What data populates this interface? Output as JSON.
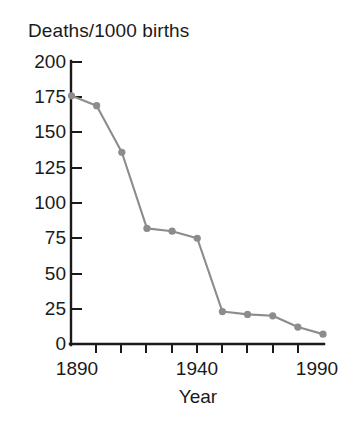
{
  "chart_data": {
    "type": "line",
    "title": "Deaths/1000 births",
    "xlabel": "Year",
    "ylabel": "",
    "x": [
      1890,
      1900,
      1910,
      1920,
      1930,
      1940,
      1950,
      1960,
      1970,
      1980,
      1990
    ],
    "values": [
      176,
      169,
      136,
      82,
      80,
      75,
      23,
      21,
      20,
      12,
      7
    ],
    "series": [
      {
        "name": "Deaths per 1000 births",
        "values": [
          176,
          169,
          136,
          82,
          80,
          75,
          23,
          21,
          20,
          12,
          7
        ]
      }
    ],
    "xlim": [
      1890,
      1990
    ],
    "ylim": [
      0,
      200
    ],
    "y_ticks": [
      0,
      25,
      50,
      75,
      100,
      125,
      150,
      175,
      200
    ],
    "y_tick_labels": [
      "0",
      "25",
      "50",
      "75",
      "100",
      "125",
      "150",
      "175",
      "200"
    ],
    "x_ticks": [
      1890,
      1900,
      1910,
      1920,
      1930,
      1940,
      1950,
      1960,
      1970,
      1980,
      1990
    ],
    "x_tick_labels_shown": [
      "1890",
      "1940",
      "1990"
    ],
    "grid": false,
    "legend": false,
    "marker": "circle",
    "line_color": "#8c8c8c",
    "marker_color": "#8c8c8c",
    "axis_color": "#1a1a1a",
    "background": "#ffffff"
  },
  "axis": {
    "y_labels": [
      "200",
      "175",
      "150",
      "125",
      "100",
      "75",
      "50",
      "25",
      "0"
    ],
    "x_labels": [
      "1890",
      "1940",
      "1990"
    ],
    "x_title": "Year"
  }
}
